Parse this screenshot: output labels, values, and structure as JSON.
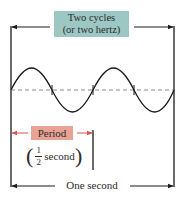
{
  "diagram": {
    "top_label_line1": "Two cycles",
    "top_label_line2": "(or two hertz)",
    "period_label": "Period",
    "period_value_num": "1",
    "period_value_den": "2",
    "period_value_unit": "second",
    "bottom_label": "One second",
    "colors": {
      "top_box": "#9cc7c2",
      "period_box": "#e8a394",
      "period_arrow": "#d9534f",
      "wave": "#1a1a1a",
      "centerline": "#8a8a8a"
    },
    "cycles": 2
  }
}
